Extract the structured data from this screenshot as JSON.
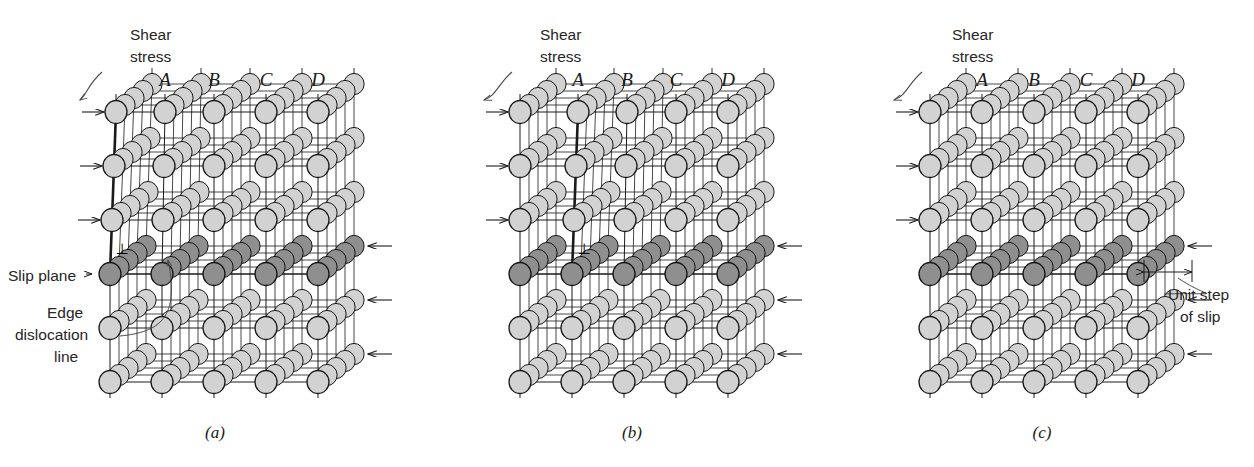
{
  "figure": {
    "type": "diagram",
    "background_color": "#ffffff",
    "width": 1254,
    "height": 467
  },
  "colors": {
    "atom_normal_fill": "#d2d2d2",
    "atom_normal_stroke": "#1a1a1a",
    "atom_slip_fill": "#8f8f8f",
    "atom_slip_stroke": "#141414",
    "atom_dark_fill": "#2a2a2a",
    "line": "#1a1a1a",
    "text": "#262626",
    "leader": "#4a4a4a"
  },
  "panels": [
    {
      "id": "a",
      "caption": "(a)",
      "caption_x": 215,
      "caption_y": 438,
      "origin_x": 110,
      "labels": {
        "shear_stress": "Shear\nstress",
        "shear_line1": "Shear",
        "shear_line2": "stress",
        "column_labels": [
          "A",
          "B",
          "C",
          "D"
        ],
        "slip_plane": "Slip plane",
        "edge_dislocation_line1": "Edge",
        "edge_dislocation_line2": "dislocation",
        "edge_dislocation_line3": "line",
        "dislocation_symbol": "⊥"
      },
      "extra_halfplane_column": "A",
      "dislocation_row_index": 3,
      "description": "Extra half plane of atoms terminating at column A above the slip plane; edge dislocation line marked"
    },
    {
      "id": "b",
      "caption": "(b)",
      "caption_x": 632,
      "caption_y": 438,
      "origin_x": 520,
      "labels": {
        "shear_line1": "Shear",
        "shear_line2": "stress",
        "column_labels": [
          "A",
          "B",
          "C",
          "D"
        ],
        "dislocation_symbol": "⊥"
      },
      "extra_halfplane_column": "B",
      "dislocation_row_index": 3,
      "description": "Dislocation has glided one interatomic distance; extra half plane now at column B"
    },
    {
      "id": "c",
      "caption": "(c)",
      "caption_x": 1042,
      "caption_y": 438,
      "origin_x": 930,
      "labels": {
        "shear_line1": "Shear",
        "shear_line2": "stress",
        "column_labels": [
          "A",
          "B",
          "C",
          "D"
        ],
        "unit_step_line1": "Unit step",
        "unit_step_line2": "of slip"
      },
      "extra_halfplane_column": null,
      "description": "Dislocation has passed out of the crystal leaving a unit step of slip at the right surface"
    }
  ],
  "lattice": {
    "columns": 5,
    "rows": 6,
    "depth_repeats": 4,
    "col_spacing": 52,
    "row_spacing": 54,
    "depth_dx": 9,
    "depth_dy": -7,
    "atom_rx": 11,
    "atom_ry": 11.5,
    "slip_row_index": 3,
    "top_y": 112
  },
  "arrows": {
    "top_shear_direction": "right",
    "bottom_shear_direction": "left",
    "top_rows": [
      0,
      1,
      2
    ],
    "bottom_rows": [
      3,
      4,
      5
    ],
    "count_per_side": 3
  },
  "annotations": {
    "unit_step_measure": {
      "label_line1": "Unit step",
      "label_line2": "of slip",
      "arrow_style": "double-headed horizontal"
    }
  }
}
